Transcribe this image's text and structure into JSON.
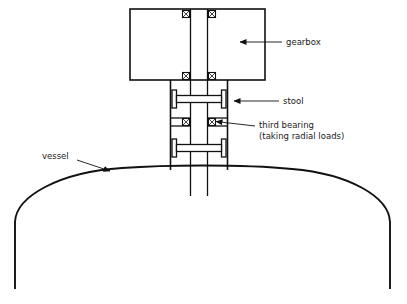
{
  "diagram": {
    "type": "engineering-cross-section",
    "background_color": "#ffffff",
    "line_color": "#111111",
    "text_color": "#1a1a1a",
    "labels": [
      {
        "key": "gearbox",
        "text": "gearbox",
        "lines": [
          "gearbox"
        ],
        "text_x": 286,
        "text_y": 45,
        "leader": {
          "from_x": 282,
          "from_y": 42,
          "to_x": 237,
          "to_y": 42
        },
        "arrow_at": "to"
      },
      {
        "key": "stool",
        "text": "stool",
        "lines": [
          "stool"
        ],
        "text_x": 283,
        "text_y": 104,
        "leader": {
          "from_x": 279,
          "from_y": 101,
          "to_x": 231,
          "to_y": 101
        },
        "arrow_at": "to"
      },
      {
        "key": "third-bearing",
        "text": "third bearing (taking radial loads)",
        "lines": [
          "third bearing",
          "(taking radial loads)"
        ],
        "text_x": 259,
        "text_y": 128,
        "leader": {
          "from_x": 255,
          "from_y": 126,
          "to_x": 212,
          "to_y": 121
        },
        "arrow_at": "to"
      },
      {
        "key": "vessel",
        "text": "vessel",
        "lines": [
          "vessel"
        ],
        "text_x": 42,
        "text_y": 159,
        "leader": {
          "from_x": 77,
          "from_y": 161,
          "to_x": 111,
          "to_y": 172
        },
        "arrow_at": "to"
      }
    ],
    "components": {
      "gearbox": {
        "x": 130,
        "y": 9,
        "width": 135,
        "height": 71
      },
      "stool": {
        "left_wall_x": 170,
        "right_wall_x": 228,
        "top_y": 80,
        "bottom_y": 172
      },
      "shaft": {
        "left_x": 190,
        "right_x": 208,
        "top_y": 9,
        "bottom_y": 196
      },
      "bearings": [
        {
          "cx": 186,
          "cy": 14,
          "size": 7,
          "location": "gearbox-upper-left"
        },
        {
          "cx": 212,
          "cy": 14,
          "size": 7,
          "location": "gearbox-upper-right"
        },
        {
          "cx": 186,
          "cy": 76,
          "size": 7,
          "location": "gearbox-lower-left"
        },
        {
          "cx": 212,
          "cy": 76,
          "size": 7,
          "location": "gearbox-lower-right"
        },
        {
          "cx": 186,
          "cy": 122,
          "size": 7,
          "location": "third-bearing-left"
        },
        {
          "cx": 212,
          "cy": 122,
          "size": 7,
          "location": "third-bearing-right"
        }
      ],
      "couplings": [
        {
          "cy": 99,
          "plate_half_height": 9,
          "plate_thickness": 4,
          "outer_x_left": 172,
          "outer_x_right": 226,
          "label": "upper-coupling-flange"
        },
        {
          "cy": 148,
          "plate_half_height": 9,
          "plate_thickness": 4,
          "outer_x_left": 172,
          "outer_x_right": 226,
          "label": "lower-coupling-flange"
        }
      ],
      "vessel": {
        "dome_left_x": 15,
        "dome_right_x": 390,
        "dome_apex_y": 166,
        "dome_spring_y": 222,
        "wall_bottom_y": 289
      }
    }
  }
}
